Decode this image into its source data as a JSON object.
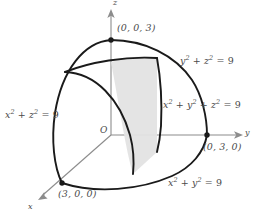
{
  "figure": {
    "colors": {
      "curve": "#1a1a1a",
      "axis": "#8c8c8c",
      "shade": "#e3e3e3",
      "text": "#4a4a4a",
      "background": "#ffffff"
    },
    "axes": [
      {
        "name": "x",
        "label": "x",
        "direction": "down-left"
      },
      {
        "name": "y",
        "label": "y",
        "direction": "right"
      },
      {
        "name": "z",
        "label": "z",
        "direction": "up"
      }
    ],
    "origin_label": "O",
    "points": [
      {
        "name": "z-intercept",
        "label": "(0, 0, 3)"
      },
      {
        "name": "y-intercept",
        "label": "(0, 3, 0)"
      },
      {
        "name": "x-intercept",
        "label": "(3, 0, 0)"
      }
    ],
    "equations": [
      {
        "name": "yz-circle",
        "plain": "y^2 + z^2 = 9",
        "lhs": "y",
        "mid": " + ",
        "var2": "z",
        "rhs": " = 9"
      },
      {
        "name": "sphere",
        "plain": "x^2 + y^2 + z^2 = 9"
      },
      {
        "name": "xz-circle",
        "plain": "x^2 + z^2 = 9"
      },
      {
        "name": "xy-circle",
        "plain": "x^2 + y^2 = 9"
      }
    ],
    "radius_value": "9",
    "exponent": "2",
    "shaded_region": {
      "name": "shaded-wedge",
      "fill": "#e3e3e3"
    }
  }
}
